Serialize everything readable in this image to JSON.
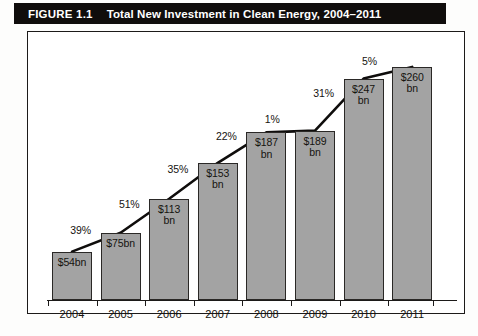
{
  "header": {
    "figure_number": "FIGURE 1.1",
    "title": "Total New Investment in Clean Energy, 2004–2011"
  },
  "chart_data": {
    "type": "bar",
    "title": "Total New Investment in Clean Energy, 2004–2011",
    "xlabel": "",
    "ylabel": "",
    "grid": false,
    "legend": "none",
    "ylim": [
      0,
      280
    ],
    "categories": [
      "2004",
      "2005",
      "2006",
      "2007",
      "2008",
      "2009",
      "2010",
      "2011"
    ],
    "values": [
      54,
      75,
      113,
      153,
      187,
      189,
      247,
      260
    ],
    "value_labels": [
      "$54bn",
      "$75bn",
      "$113 bn",
      "$153 bn",
      "$187 bn",
      "$189 bn",
      "$247 bn",
      "$260 bn"
    ],
    "growth_labels": [
      "39%",
      "51%",
      "35%",
      "22%",
      "1%",
      "31%",
      "5%"
    ],
    "growth_between": [
      "2004→2005",
      "2005→2006",
      "2006→2007",
      "2007→2008",
      "2008→2009",
      "2009→2010",
      "2010→2011"
    ],
    "overlay": "trend-line-connecting-bar-tops",
    "colors": {
      "bar_fill": "#a3a3a3",
      "bar_border": "#2a2826",
      "trend_line": "#0f0d0c",
      "banner_background": "#100d0c",
      "banner_text": "#ffffff"
    }
  }
}
